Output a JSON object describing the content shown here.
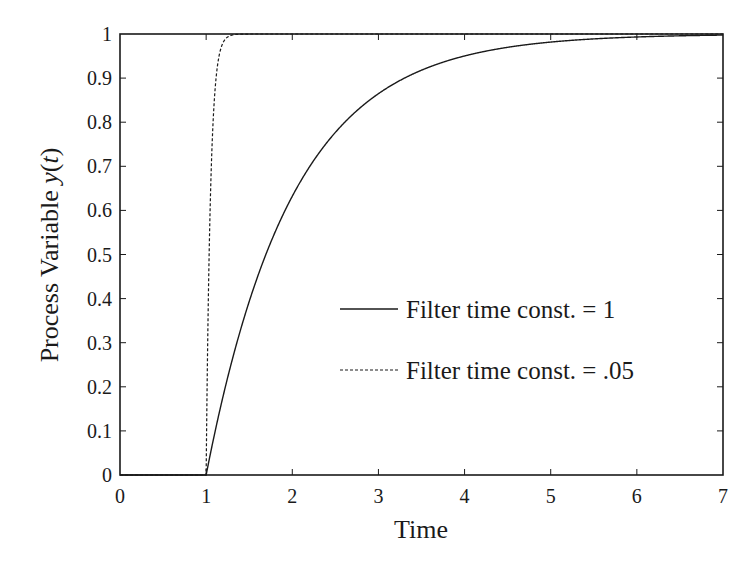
{
  "chart_data": {
    "type": "line",
    "title": "",
    "xlabel": "Time",
    "ylabel": "Process Variable y(t)",
    "ylabel_parts": {
      "prefix": "Process Variable ",
      "var": "y",
      "open": "(",
      "arg": "t",
      "close": ")"
    },
    "xlim": [
      0,
      7
    ],
    "ylim": [
      0,
      1
    ],
    "xticks": [
      0,
      1,
      2,
      3,
      4,
      5,
      6,
      7
    ],
    "xtick_labels": [
      "0",
      "1",
      "2",
      "3",
      "4",
      "5",
      "6",
      "7"
    ],
    "yticks": [
      0,
      0.1,
      0.2,
      0.3,
      0.4,
      0.5,
      0.6,
      0.7,
      0.8,
      0.9,
      1
    ],
    "ytick_labels": [
      "0",
      "0.1",
      "0.2",
      "0.3",
      "0.4",
      "0.5",
      "0.6",
      "0.7",
      "0.8",
      "0.9",
      "1"
    ],
    "grid": false,
    "legend_position": "center-right",
    "series": [
      {
        "name": "Filter time const. = 1",
        "style": "solid",
        "color": "#1a1a1a",
        "x": [
          0,
          1,
          1.25,
          1.5,
          1.75,
          2,
          2.5,
          3,
          3.5,
          4,
          4.5,
          5,
          5.5,
          6,
          6.5,
          7
        ],
        "y": [
          0,
          0,
          0.221,
          0.393,
          0.528,
          0.632,
          0.777,
          0.865,
          0.918,
          0.95,
          0.97,
          0.982,
          0.989,
          0.993,
          0.996,
          0.998
        ]
      },
      {
        "name": "Filter time const. = .05",
        "style": "dashed",
        "color": "#1a1a1a",
        "x": [
          0,
          1,
          1.025,
          1.05,
          1.075,
          1.1,
          1.15,
          1.2,
          1.25,
          1.3,
          1.4,
          2,
          7
        ],
        "y": [
          0,
          0,
          0.393,
          0.632,
          0.777,
          0.865,
          0.95,
          0.982,
          0.993,
          0.998,
          1.0,
          1.0,
          1.0
        ]
      }
    ]
  }
}
